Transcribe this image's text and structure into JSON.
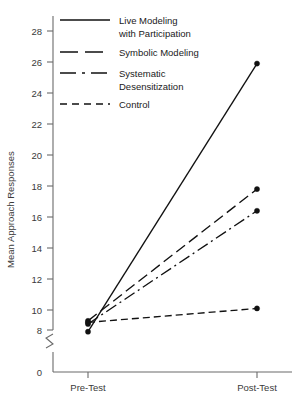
{
  "chart_data": {
    "type": "line",
    "title": "",
    "xlabel": "",
    "ylabel": "Mean Approach Responses",
    "categories": [
      "Pre-Test",
      "Post-Test"
    ],
    "x": [
      0,
      1
    ],
    "ylim": [
      8,
      29
    ],
    "yticks": [
      8,
      10,
      12,
      14,
      16,
      18,
      20,
      22,
      24,
      26,
      28
    ],
    "ytick_labels": [
      "8",
      "10",
      "12",
      "14",
      "16",
      "18",
      "20",
      "22",
      "24",
      "26",
      "28"
    ],
    "zero_tick_label": "0",
    "axis_break": true,
    "grid": false,
    "legend_position": "top-left",
    "series": [
      {
        "name": "Live Modeling with Participation",
        "label_line_1": "Live Modeling",
        "label_line_2": "with Participation",
        "style": "solid",
        "values": [
          8.6,
          25.9
        ]
      },
      {
        "name": "Symbolic Modeling",
        "label_line_1": "Symbolic Modeling",
        "label_line_2": "",
        "style": "long-dash",
        "values": [
          9.3,
          17.8
        ]
      },
      {
        "name": "Systematic Desensitization",
        "label_line_1": "Systematic",
        "label_line_2": "Desensitization",
        "style": "dash-dot",
        "values": [
          9.1,
          16.4
        ]
      },
      {
        "name": "Control",
        "label_line_1": "Control",
        "label_line_2": "",
        "style": "dashed",
        "values": [
          9.2,
          10.1
        ]
      }
    ],
    "colors": {
      "line": "#111111",
      "axis": "#6b6b6b",
      "text": "#1a1a1a",
      "background": "#ffffff"
    }
  },
  "y_ticks": [
    {
      "label": "28"
    },
    {
      "label": "26"
    },
    {
      "label": "24"
    },
    {
      "label": "22"
    },
    {
      "label": "20"
    },
    {
      "label": "18"
    },
    {
      "label": "16"
    },
    {
      "label": "14"
    },
    {
      "label": "12"
    },
    {
      "label": "10"
    },
    {
      "label": "8"
    }
  ],
  "zero_label": "0",
  "x_ticks": [
    {
      "label": "Pre-Test"
    },
    {
      "label": "Post-Test"
    }
  ],
  "y_axis_title": "Mean Approach Responses",
  "legend": [
    {
      "line1": "Live Modeling",
      "line2": "with Participation"
    },
    {
      "line1": "Symbolic Modeling",
      "line2": ""
    },
    {
      "line1": "Systematic",
      "line2": "Desensitization"
    },
    {
      "line1": "Control",
      "line2": ""
    }
  ]
}
